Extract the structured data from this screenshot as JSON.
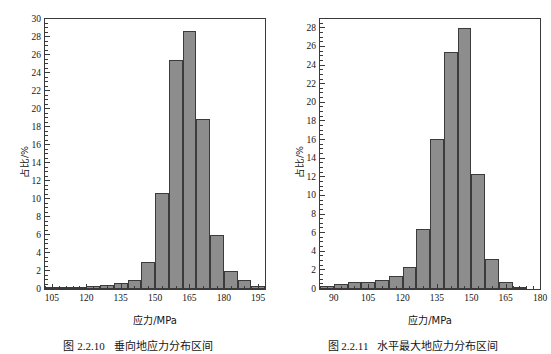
{
  "page": {
    "top_cut_text": "· · · ·· · ··· · ··· ·· ·· · ··· ··· · ·· ·· ··· ·",
    "bar_color": "#8d8d8d",
    "bar_edge_color": "#3b3b3b",
    "axis_color": "#3a3a3a"
  },
  "figures": [
    {
      "id": "fig-2-2-10",
      "caption_number": "图 2.2.10",
      "caption_text": "垂向地应力分布区间",
      "ytitle": "占比/%",
      "xtitle": "应力/MPa"
    },
    {
      "id": "fig-2-2-11",
      "caption_number": "图 2.2.11",
      "caption_text": "水平最大地应力分布区间",
      "ytitle": "占比/%",
      "xtitle": "应力/MPa"
    }
  ],
  "chart_data": [
    {
      "type": "bar",
      "title": "垂向地应力分布区间",
      "xlabel": "应力/MPa",
      "ylabel": "占比/%",
      "xlim": [
        102,
        198
      ],
      "ylim": [
        0,
        30
      ],
      "xticks": [
        105,
        120,
        135,
        150,
        165,
        180,
        195
      ],
      "yticks": [
        0,
        2,
        4,
        6,
        8,
        10,
        12,
        14,
        16,
        18,
        20,
        22,
        24,
        26,
        28,
        30
      ],
      "xtick_minor_step": 3,
      "ytick_minor_step": 0.5,
      "grid": false,
      "legend": false,
      "bin_width": 6,
      "bin_centers": [
        105,
        111,
        117,
        123,
        129,
        135,
        141,
        147,
        153,
        159,
        165,
        171,
        177,
        183,
        189,
        195
      ],
      "values": [
        0.15,
        0.15,
        0.2,
        0.3,
        0.45,
        0.65,
        1.0,
        3.0,
        10.7,
        25.4,
        28.7,
        18.9,
        6.0,
        2.0,
        1.0,
        0.3
      ]
    },
    {
      "type": "bar",
      "title": "水平最大地应力分布区间",
      "xlabel": "应力/MPa",
      "ylabel": "占比/%",
      "xlim": [
        84,
        180
      ],
      "ylim": [
        0,
        29
      ],
      "xticks": [
        90,
        105,
        120,
        135,
        150,
        165,
        180
      ],
      "yticks": [
        0,
        2,
        4,
        6,
        8,
        10,
        12,
        14,
        16,
        18,
        20,
        22,
        24,
        26,
        28
      ],
      "xtick_minor_step": 3,
      "ytick_minor_step": 0.5,
      "grid": false,
      "legend": false,
      "bin_width": 6,
      "bin_centers": [
        87,
        93,
        99,
        105,
        111,
        117,
        123,
        129,
        135,
        141,
        147,
        153,
        159,
        165,
        171
      ],
      "values": [
        0.35,
        0.55,
        0.7,
        0.8,
        1.0,
        1.45,
        2.4,
        6.4,
        16.1,
        25.5,
        28.0,
        12.3,
        3.25,
        0.75,
        0.25
      ]
    }
  ]
}
